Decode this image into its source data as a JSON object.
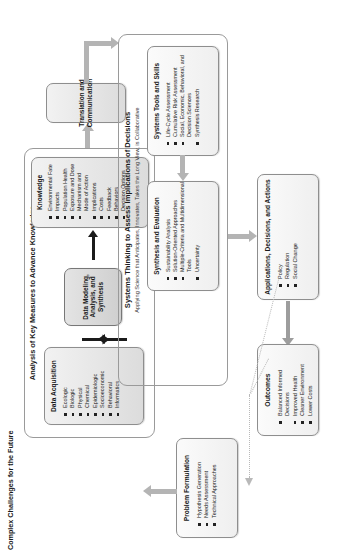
{
  "diagram": {
    "title": "Complex Challenges for the Future",
    "sections": {
      "advance_knowledge": {
        "title": "Analysis of Key Measures to Advance Knowledge"
      },
      "systems_thinking": {
        "title": "Systems Thinking to Assess Implications of Decisions",
        "subtitle": "Applying Science that Anticipates, Innovates, Takes the Long View, is Collaborative"
      }
    },
    "boxes": {
      "problem_formulation": {
        "title": "Problem Formulation",
        "items": [
          "Hypothesis Generation",
          "Needs Assessment",
          "Technical Approaches"
        ]
      },
      "data_acquisition": {
        "title": "Data Acquisition",
        "items": [
          "Ecologic",
          "Biologic",
          "Physical",
          "Chemical",
          "Epidemiologic",
          "Socioeconomic",
          "Behavioral",
          "Informatics"
        ]
      },
      "data_modeling": {
        "title": "Data Modeling, Analysis, and Synthesis"
      },
      "knowledge": {
        "title": "Knowledge",
        "items": [
          "Environmental Fate",
          "Impacts",
          "Population Health",
          "Exposure and Dose",
          "Mechanism and Mode of Action",
          "Implications",
          "Costs",
          "Feedback",
          "Behaviors",
          "Decision Options"
        ]
      },
      "translation": {
        "title": "Translation and Communication"
      },
      "systems_tools": {
        "title": "Systems Tools and Skills",
        "items": [
          "Life-Cycle Assessment",
          "Cumulative Risk Assessment",
          "Social, Economic, Behavioral, and Decision Sciences",
          "Synthesis Research"
        ]
      },
      "synthesis_evaluation": {
        "title": "Synthesis and Evaluation",
        "items": [
          "Sustainability Analysis",
          "Solution-Oriented Approaches",
          "Multiple-Criteria and Multidimensional Tools",
          "Uncertainty"
        ]
      },
      "applications": {
        "title": "Applications, Decisions, and Actions",
        "items": [
          "Policy",
          "Regulation",
          "Social Change"
        ]
      },
      "outcomes": {
        "title": "Outcomes",
        "items": [
          "Balanced Informed Decisions",
          "Improved Health",
          "Cleaner Environment",
          "Lower Costs"
        ]
      }
    }
  }
}
